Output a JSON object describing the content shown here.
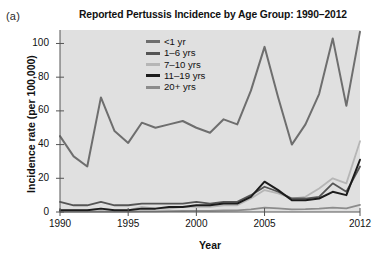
{
  "panel_label": "(a)",
  "chart_data": {
    "type": "line",
    "title": "Reported Pertussis Incidence by Age Group: 1990–2012",
    "xlabel": "Year",
    "ylabel": "Incidence rate (per 100,000)",
    "xlim": [
      1990,
      2012
    ],
    "ylim": [
      0,
      108
    ],
    "xticks": [
      1990,
      1995,
      2000,
      2005,
      2012
    ],
    "xtick_labels": [
      "1990",
      "1995",
      "2000",
      "2005",
      "2012"
    ],
    "yticks": [
      0,
      20,
      40,
      60,
      80,
      100
    ],
    "ytick_labels": [
      "0",
      "20",
      "40",
      "60",
      "80",
      "100"
    ],
    "grid": false,
    "legend_position": "top-center",
    "plot_background": "#e0e0e0",
    "x": [
      1990,
      1991,
      1992,
      1993,
      1994,
      1995,
      1996,
      1997,
      1998,
      1999,
      2000,
      2001,
      2002,
      2003,
      2004,
      2005,
      2006,
      2007,
      2008,
      2009,
      2010,
      2011,
      2012
    ],
    "series": [
      {
        "name": "<1 yr",
        "color": "#6e6e6e",
        "width": 2.0,
        "values": [
          45,
          33,
          27,
          68,
          48,
          41,
          53,
          50,
          52,
          54,
          50,
          47,
          55,
          52,
          72,
          98,
          68,
          40,
          52,
          70,
          103,
          63,
          107
        ]
      },
      {
        "name": "1–6 yrs",
        "color": "#555555",
        "width": 1.8,
        "values": [
          6,
          4,
          4,
          6,
          4,
          4,
          5,
          5,
          5,
          5,
          6,
          5,
          6,
          6,
          10,
          15,
          12,
          8,
          8,
          9,
          17,
          12,
          27
        ]
      },
      {
        "name": "7–10 yrs",
        "color": "#b6b6b6",
        "width": 1.8,
        "values": [
          1,
          1,
          1,
          2,
          1,
          1,
          3,
          2,
          2,
          3,
          3,
          3,
          4,
          4,
          8,
          13,
          11,
          8,
          9,
          14,
          20,
          17,
          42
        ]
      },
      {
        "name": "11–19 yrs",
        "color": "#1c1c1c",
        "width": 2.0,
        "values": [
          1,
          1,
          1,
          2,
          1,
          1,
          2,
          2,
          3,
          3,
          4,
          4,
          5,
          5,
          9,
          18,
          13,
          7,
          7,
          8,
          12,
          10,
          31
        ]
      },
      {
        "name": "20+ yrs",
        "color": "#8c8c8c",
        "width": 1.8,
        "values": [
          0.2,
          0.2,
          0.2,
          0.3,
          0.2,
          0.3,
          0.4,
          0.4,
          0.5,
          0.6,
          0.7,
          0.7,
          0.9,
          1.0,
          1.6,
          2.6,
          2.2,
          1.6,
          1.7,
          2.0,
          2.6,
          2.2,
          4.2
        ]
      }
    ]
  }
}
